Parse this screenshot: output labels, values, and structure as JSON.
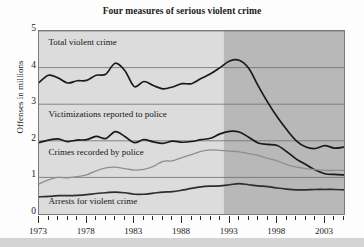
{
  "chart_data": {
    "type": "line",
    "title": "Four measures of serious violent crime",
    "xlabel": "",
    "ylabel": "Offenses in millions",
    "xlim": [
      1973,
      2005
    ],
    "ylim": [
      0,
      5
    ],
    "grid": true,
    "legend": "inline-labels",
    "x_ticks": [
      "1973",
      "1978",
      "1983",
      "1988",
      "1993",
      "1998",
      "2003"
    ],
    "x_tick_values": [
      1973,
      1978,
      1983,
      1988,
      1993,
      1998,
      2003
    ],
    "y_ticks": [
      "0",
      "1",
      "2",
      "3",
      "4",
      "5"
    ],
    "y_tick_values": [
      0,
      1,
      2,
      3,
      4,
      5
    ],
    "x": [
      1973,
      1974,
      1975,
      1976,
      1977,
      1978,
      1979,
      1980,
      1981,
      1982,
      1983,
      1984,
      1985,
      1986,
      1987,
      1988,
      1989,
      1990,
      1991,
      1992,
      1993,
      1994,
      1995,
      1996,
      1997,
      1998,
      1999,
      2000,
      2001,
      2002,
      2003,
      2004,
      2005
    ],
    "shaded_region": {
      "from": 1992.4,
      "to": 2005,
      "color": "#b8b8b8",
      "note": "darker shaded band covering 1993 onward"
    },
    "plot_background": "#dcdcdc",
    "series": [
      {
        "name": "Total violent crime",
        "color": "#1a1a1a",
        "label_x": 1974.1,
        "label_y": 4.62,
        "values": [
          3.59,
          3.79,
          3.72,
          3.58,
          3.64,
          3.65,
          3.79,
          3.82,
          4.12,
          3.92,
          3.48,
          3.62,
          3.51,
          3.42,
          3.47,
          3.56,
          3.56,
          3.7,
          3.83,
          4.0,
          4.18,
          4.2,
          3.98,
          3.5,
          3.05,
          2.65,
          2.3,
          2.0,
          1.83,
          1.79,
          1.87,
          1.8,
          1.83
        ]
      },
      {
        "name": "Victimizations reported to police",
        "color": "#1a1a1a",
        "label_x": 1974.1,
        "label_y": 2.66,
        "values": [
          1.95,
          2.02,
          2.05,
          1.98,
          2.02,
          2.03,
          2.12,
          2.06,
          2.25,
          2.12,
          1.95,
          2.03,
          1.97,
          1.93,
          1.99,
          1.96,
          1.98,
          2.03,
          2.07,
          2.19,
          2.26,
          2.24,
          2.1,
          1.94,
          1.9,
          1.87,
          1.7,
          1.5,
          1.35,
          1.2,
          1.1,
          1.08,
          1.07
        ]
      },
      {
        "name": "Crimes recorded by police",
        "color": "#8e8e8e",
        "label_x": 1974.1,
        "label_y": 1.62,
        "values": [
          0.82,
          0.93,
          1.0,
          0.99,
          1.02,
          1.07,
          1.18,
          1.26,
          1.28,
          1.24,
          1.2,
          1.22,
          1.3,
          1.44,
          1.45,
          1.54,
          1.62,
          1.71,
          1.75,
          1.74,
          1.72,
          1.7,
          1.65,
          1.6,
          1.52,
          1.45,
          1.35,
          1.28,
          1.24,
          1.21,
          1.19,
          1.19,
          1.19
        ]
      },
      {
        "name": "Arrests for violent crime",
        "color": "#2e2e2e",
        "label_x": 1974.1,
        "label_y": 0.28,
        "values": [
          0.47,
          0.48,
          0.5,
          0.5,
          0.51,
          0.53,
          0.56,
          0.58,
          0.6,
          0.58,
          0.54,
          0.54,
          0.57,
          0.6,
          0.61,
          0.65,
          0.7,
          0.74,
          0.76,
          0.77,
          0.8,
          0.83,
          0.8,
          0.77,
          0.75,
          0.71,
          0.68,
          0.66,
          0.66,
          0.67,
          0.67,
          0.67,
          0.66
        ]
      }
    ]
  }
}
